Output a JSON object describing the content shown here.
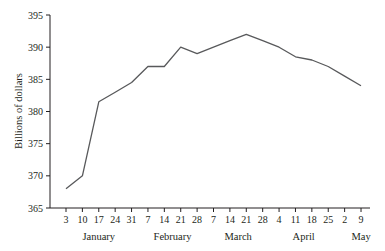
{
  "chart_data": {
    "type": "line",
    "title": "",
    "xlabel": "",
    "ylabel": "Billions of dollars",
    "ylim": [
      365,
      395
    ],
    "yticks": [
      365,
      370,
      375,
      380,
      385,
      390,
      395
    ],
    "grid": false,
    "legend": null,
    "x_tick_labels": [
      "3",
      "10",
      "17",
      "24",
      "31",
      "7",
      "14",
      "21",
      "28",
      "7",
      "14",
      "21",
      "28",
      "4",
      "11",
      "18",
      "25",
      "2",
      "9"
    ],
    "month_labels": [
      {
        "label": "January",
        "center_index": 2
      },
      {
        "label": "February",
        "center_index": 6.5
      },
      {
        "label": "March",
        "center_index": 10.5
      },
      {
        "label": "April",
        "center_index": 14.5
      },
      {
        "label": "May",
        "center_index": 18
      }
    ],
    "categories": [
      "Jan 3",
      "Jan 10",
      "Jan 17",
      "Jan 24",
      "Jan 31",
      "Feb 7",
      "Feb 14",
      "Feb 21",
      "Feb 28",
      "Mar 7",
      "Mar 14",
      "Mar 21",
      "Mar 28",
      "Apr 4",
      "Apr 11",
      "Apr 18",
      "Apr 25",
      "May 2",
      "May 9"
    ],
    "series": [
      {
        "name": "Billions of dollars",
        "color": "#58595b",
        "values": [
          368,
          370,
          381.5,
          383,
          384.5,
          387,
          387,
          390,
          389,
          390,
          391,
          392,
          391,
          390,
          388.5,
          388,
          387,
          385.5,
          384
        ]
      }
    ]
  },
  "colors": {
    "axis": "#231f20",
    "line": "#58595b",
    "background": "#ffffff"
  }
}
